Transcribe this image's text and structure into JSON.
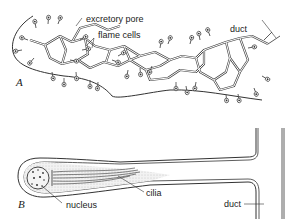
{
  "panel_a": {
    "letter": "A",
    "labels": {
      "excretory_pore": "excretory pore",
      "flame_cells": "flame cells",
      "duct": "duct"
    }
  },
  "panel_b": {
    "letter": "B",
    "labels": {
      "nucleus": "nucleus",
      "cilia": "cilia",
      "duct": "duct"
    }
  },
  "colors": {
    "line": "#333333",
    "stipple": "#e6e6e6",
    "background": "#ffffff"
  }
}
